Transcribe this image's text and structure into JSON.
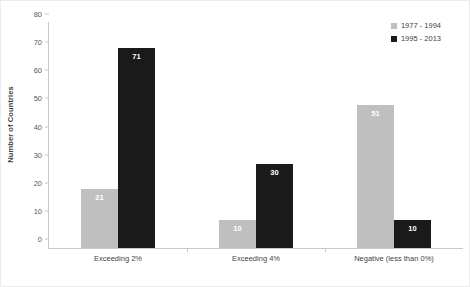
{
  "chart_data": {
    "type": "bar",
    "title": "",
    "subtitle": "",
    "xlabel": "",
    "ylabel": "Number of Countries",
    "ylim": [
      0,
      80
    ],
    "yticks": [
      0,
      10,
      20,
      30,
      40,
      50,
      60,
      70,
      80
    ],
    "grid": false,
    "legend_position": "top-right",
    "categories": [
      "Exceeding 2%",
      "Exceeding 4%",
      "Negative (less than 0%)"
    ],
    "series": [
      {
        "name": "1977 - 1994",
        "color": "#BFBFBF",
        "values": [
          21,
          10,
          51
        ]
      },
      {
        "name": "1995 - 2013",
        "color": "#1A1A1A",
        "values": [
          71,
          30,
          10
        ]
      }
    ]
  },
  "legend": {
    "items": [
      {
        "label": "1977 - 1994",
        "color": "#BFBFBF"
      },
      {
        "label": "1995 - 2013",
        "color": "#1A1A1A"
      }
    ]
  }
}
